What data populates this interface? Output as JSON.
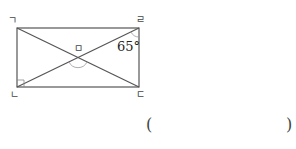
{
  "diagram": {
    "shape": "rectangle",
    "vertices": {
      "top_left": {
        "label": "ㄱ",
        "x": 17,
        "y": 28
      },
      "top_right": {
        "label": "ㄹ",
        "x": 139,
        "y": 28
      },
      "bottom_right": {
        "label": "ㄷ",
        "x": 139,
        "y": 87
      },
      "bottom_left": {
        "label": "ㄴ",
        "x": 17,
        "y": 87
      }
    },
    "intersection": {
      "label": "ㅁ",
      "x": 78,
      "y": 57.5
    },
    "diagonals": [
      "ㄱㄷ",
      "ㄴㄹ"
    ],
    "angle_given": {
      "label": "65°",
      "vertex": "ㄹ",
      "between": [
        "ㄹㄷ",
        "ㄹㅁ"
      ]
    },
    "right_angle_marker": {
      "vertex": "ㄴ"
    },
    "unknown_angle_marker": {
      "vertex": "ㅁ",
      "between": [
        "ㅁㄴ",
        "ㅁㄷ"
      ]
    },
    "line_color": "#555555"
  },
  "answer": {
    "open_paren": "(",
    "close_paren": ")",
    "value": ""
  }
}
